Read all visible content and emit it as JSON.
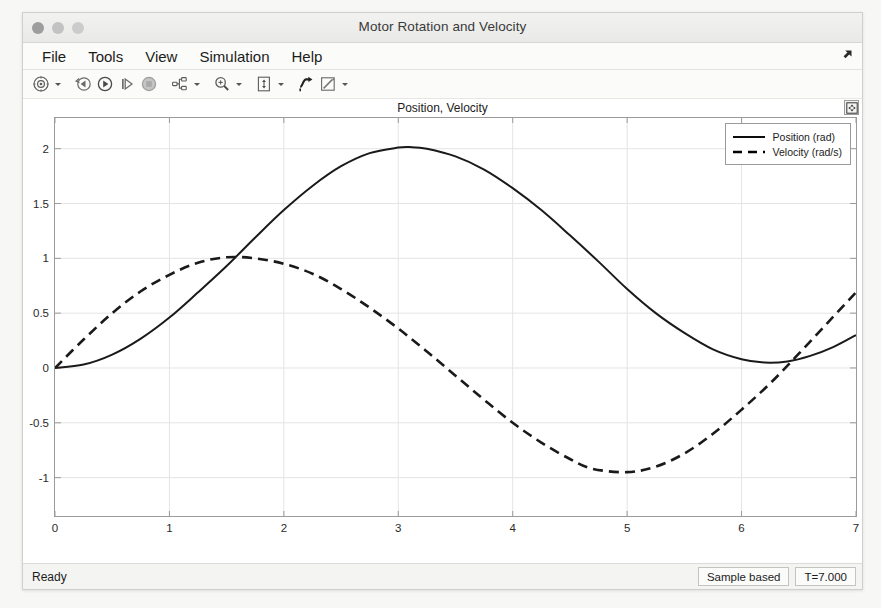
{
  "window": {
    "title": "Motor Rotation and Velocity",
    "controls": [
      {
        "name": "close-button",
        "color": "#9d9d9d"
      },
      {
        "name": "minimize-button",
        "color": "#c2c2c2"
      },
      {
        "name": "maximize-button",
        "color": "#cccccc"
      }
    ]
  },
  "menubar": {
    "items": [
      "File",
      "Tools",
      "View",
      "Simulation",
      "Help"
    ],
    "corner_icon": "undock-arrow-icon"
  },
  "toolbar": {
    "buttons": [
      {
        "name": "configuration-properties-button",
        "icon": "gear-circle-icon",
        "has_dropdown": true
      },
      {
        "name": "rewind-button",
        "icon": "rewind-icon",
        "has_dropdown": false
      },
      {
        "name": "run-button",
        "icon": "play-icon",
        "has_dropdown": false
      },
      {
        "name": "step-forward-button",
        "icon": "step-forward-icon",
        "has_dropdown": false
      },
      {
        "name": "stop-button",
        "icon": "stop-icon",
        "has_dropdown": false
      },
      {
        "name": "signal-selection-button",
        "icon": "signal-selector-icon",
        "has_dropdown": true
      },
      {
        "name": "zoom-in-button",
        "icon": "zoom-in-icon",
        "has_dropdown": true
      },
      {
        "name": "autoscale-button",
        "icon": "autoscale-icon",
        "has_dropdown": true
      },
      {
        "name": "cursor-measurements-button",
        "icon": "cursor-measure-icon",
        "has_dropdown": false
      },
      {
        "name": "annotations-button",
        "icon": "annotation-pencil-icon",
        "has_dropdown": true
      }
    ]
  },
  "plot": {
    "float_button_icon": "dock-scope-icon"
  },
  "statusbar": {
    "ready": "Ready",
    "sample_mode": "Sample based",
    "time": "T=7.000"
  },
  "chart_data": {
    "type": "line",
    "title": "Position, Velocity",
    "xlabel": "",
    "ylabel": "",
    "xlim": [
      0,
      7
    ],
    "ylim": [
      -1.35,
      2.28
    ],
    "xticks": [
      0,
      1,
      2,
      3,
      4,
      5,
      6,
      7
    ],
    "yticks": [
      2,
      1.5,
      1,
      0.5,
      0,
      -0.5,
      -1
    ],
    "ytick_labels": [
      "2",
      "1.5",
      "1",
      "0.5",
      "0",
      "-0.5",
      "-1"
    ],
    "xtick_labels": [
      "0",
      "1",
      "2",
      "3",
      "4",
      "5",
      "6",
      "7"
    ],
    "grid": true,
    "grid_color": "#e4e4e4",
    "axis_color": "#9b9b9b",
    "legend": {
      "position": "top-right",
      "entries": [
        {
          "label": "Position (rad)",
          "style": "solid",
          "color": "#000000"
        },
        {
          "label": "Velocity (rad/s)",
          "style": "dashed",
          "color": "#000000"
        }
      ]
    },
    "series": [
      {
        "name": "Position (rad)",
        "style": "solid",
        "color": "#1a1a1a",
        "x": [
          0,
          0.25,
          0.5,
          0.75,
          1,
          1.25,
          1.5,
          1.75,
          2,
          2.25,
          2.5,
          2.75,
          3,
          3.1,
          3.25,
          3.5,
          3.75,
          4,
          4.25,
          4.5,
          4.75,
          5,
          5.25,
          5.5,
          5.75,
          6,
          6.2,
          6.4,
          6.6,
          6.8,
          7
        ],
        "y": [
          0.0,
          0.031,
          0.122,
          0.268,
          0.46,
          0.69,
          0.93,
          1.19,
          1.44,
          1.66,
          1.84,
          1.96,
          2.01,
          2.015,
          2.0,
          1.93,
          1.81,
          1.64,
          1.44,
          1.21,
          0.97,
          0.72,
          0.5,
          0.32,
          0.17,
          0.08,
          0.05,
          0.06,
          0.11,
          0.19,
          0.3
        ]
      },
      {
        "name": "Velocity (rad/s)",
        "style": "dashed",
        "color": "#1a1a1a",
        "x": [
          0,
          0.25,
          0.5,
          0.75,
          1,
          1.25,
          1.5,
          1.75,
          2,
          2.25,
          2.5,
          2.75,
          3,
          3.25,
          3.5,
          3.75,
          4,
          4.25,
          4.5,
          4.7,
          5,
          5.25,
          5.5,
          5.75,
          6,
          6.25,
          6.5,
          6.75,
          7
        ],
        "y": [
          0.0,
          0.26,
          0.5,
          0.7,
          0.85,
          0.96,
          1.01,
          1.0,
          0.95,
          0.86,
          0.72,
          0.55,
          0.36,
          0.15,
          -0.07,
          -0.29,
          -0.5,
          -0.68,
          -0.83,
          -0.92,
          -0.95,
          -0.9,
          -0.78,
          -0.6,
          -0.38,
          -0.14,
          0.13,
          0.41,
          0.69
        ]
      }
    ]
  }
}
